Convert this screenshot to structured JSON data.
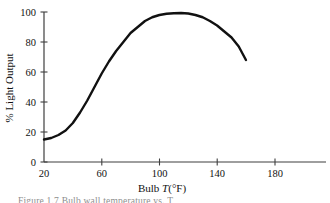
{
  "figure": {
    "caption_partial": "Figure 1.7   Bulb wall temperature vs. T",
    "background_color": "#ffffff",
    "line_color": "#111111",
    "axis_color": "#4a4a4a"
  },
  "chart_data": {
    "type": "line",
    "title": "",
    "subtitle": "",
    "xlabel_plain": "Bulb T(°F)",
    "xlabel_prefix": "Bulb ",
    "xlabel_symbol": "T",
    "xlabel_suffix": "(°F)",
    "ylabel": "% Light Output",
    "xlim": [
      20,
      196
    ],
    "ylim": [
      0,
      104
    ],
    "xticks": [
      20,
      60,
      100,
      140,
      180
    ],
    "xticklabels": [
      "20",
      "60",
      "100",
      "140",
      "180"
    ],
    "yticks": [
      0,
      20,
      40,
      60,
      80,
      100
    ],
    "yticklabels": [
      "0",
      "20",
      "40",
      "60",
      "80",
      "100"
    ],
    "grid": false,
    "legend": null,
    "legend_position": "none",
    "series": [
      {
        "name": "% Light Output",
        "x": [
          20,
          25,
          30,
          35,
          40,
          45,
          50,
          55,
          60,
          65,
          70,
          75,
          80,
          85,
          90,
          95,
          100,
          105,
          110,
          115,
          120,
          125,
          130,
          135,
          140,
          145,
          150,
          155,
          160
        ],
        "y": [
          15,
          16,
          18,
          21,
          26,
          33,
          41,
          50,
          59,
          67,
          74,
          80,
          86,
          90,
          94,
          96.5,
          98,
          98.8,
          99.2,
          99.3,
          99,
          98,
          96.5,
          94,
          91,
          87,
          83,
          77,
          68
        ]
      }
    ]
  }
}
